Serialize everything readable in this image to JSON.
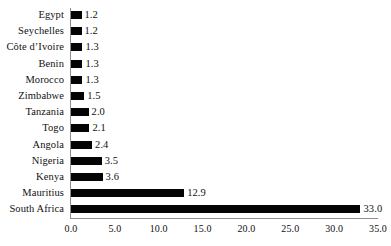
{
  "chart_data": {
    "type": "bar",
    "orientation": "horizontal",
    "title": "",
    "subtitle": "",
    "xlabel": "",
    "ylabel": "",
    "xlim": [
      0.0,
      35.0
    ],
    "xticks": [
      "0.0",
      "5.0",
      "10.0",
      "15.0",
      "20.0",
      "25.0",
      "30.0",
      "35.0"
    ],
    "xtick_values": [
      0,
      5,
      10,
      15,
      20,
      25,
      30,
      35
    ],
    "grid": false,
    "legend": null,
    "bar_color": "#040404",
    "axis_color": "#8e8e8e",
    "categories": [
      "Egypt",
      "Seychelles",
      "Côte d’Ivoire",
      "Benin",
      "Morocco",
      "Zimbabwe",
      "Tanzania",
      "Togo",
      "Angola",
      "Nigeria",
      "Kenya",
      "Mauritius",
      "South Africa"
    ],
    "values": [
      1.2,
      1.2,
      1.3,
      1.3,
      1.3,
      1.5,
      2.0,
      2.1,
      2.4,
      3.5,
      3.6,
      12.9,
      33.0
    ],
    "value_labels": [
      "1.2",
      "1.2",
      "1.3",
      "1.3",
      "1.3",
      "1.5",
      "2.0",
      "2.1",
      "2.4",
      "3.5",
      "3.6",
      "12.9",
      "33.0"
    ]
  }
}
